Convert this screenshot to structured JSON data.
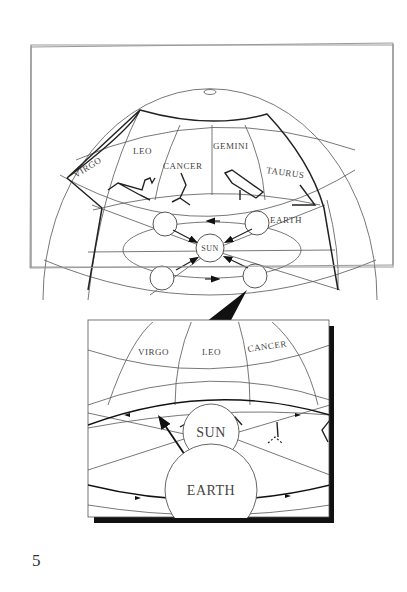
{
  "figure": {
    "page_number": "5",
    "sphere": {
      "constellation_labels": [
        "VIRGO",
        "LEO",
        "CANCER",
        "GEMINI",
        "TAURUS"
      ],
      "earth_label": "EARTH",
      "sun_label": "SUN"
    },
    "inset": {
      "constellation_labels": [
        "VIRGO",
        "LEO",
        "CANCER"
      ],
      "sun_label": "SUN",
      "earth_label": "EARTH"
    }
  }
}
